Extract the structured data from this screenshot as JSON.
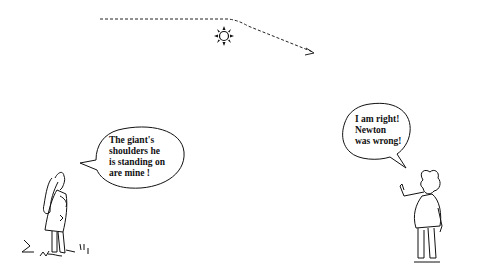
{
  "scene": {
    "description": "Cartoon of light bending around the sun, with two figures debating",
    "light_ray": {
      "label": "light-ray-path",
      "style": "dashed"
    },
    "sun": {
      "label": "sun"
    }
  },
  "left_figure": {
    "speech": "The giant's\nshoulders he\nis standing on\nare mine !"
  },
  "right_figure": {
    "speech": "I am right!\nNewton\nwas wrong!"
  },
  "colors": {
    "ink": "#111111",
    "background": "#ffffff"
  }
}
